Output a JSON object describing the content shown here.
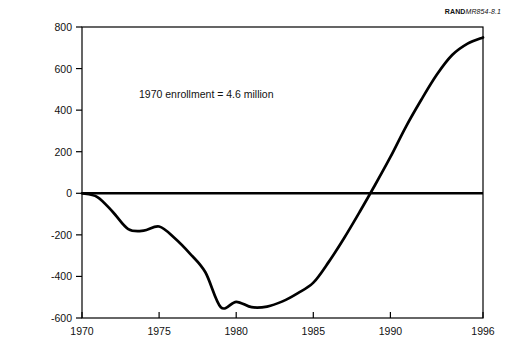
{
  "figure": {
    "document_code_brand": "RAND",
    "document_code_number": "MR854-8.1"
  },
  "annotation": {
    "note": "1970 enrollment = 4.6 million"
  },
  "chart_data": {
    "type": "line",
    "title": "",
    "subtitle": "",
    "xlabel": "",
    "ylabel": "K−12 enrollment relative to 1970 (thousands)",
    "xlim": [
      1970,
      1996
    ],
    "ylim": [
      -600,
      800
    ],
    "grid": false,
    "legend": false,
    "legend_position": "none",
    "line_color": "#000000",
    "zero_line": 0,
    "xticks": [
      1970,
      1975,
      1980,
      1985,
      1990,
      1996
    ],
    "xtick_labels": [
      "1970",
      "1975",
      "1980",
      "1985",
      "1990",
      "1996"
    ],
    "yticks": [
      -600,
      -400,
      -200,
      0,
      200,
      400,
      600,
      800
    ],
    "ytick_labels": [
      "-600",
      "-400",
      "-200",
      "0",
      "200",
      "400",
      "600",
      "800"
    ],
    "annotations": [
      {
        "text": "1970 enrollment = 4.6 million",
        "x": 1974.2,
        "y": 470
      }
    ],
    "series": [
      {
        "name": "K-12 enrollment relative to 1970",
        "x": [
          1970,
          1971,
          1972,
          1973,
          1974,
          1975,
          1976,
          1977,
          1978,
          1979,
          1980,
          1981,
          1982,
          1983,
          1984,
          1985,
          1986,
          1987,
          1988,
          1989,
          1990,
          1991,
          1992,
          1993,
          1994,
          1995,
          1996
        ],
        "values": [
          0,
          -18,
          -90,
          -172,
          -180,
          -160,
          -215,
          -290,
          -380,
          -548,
          -522,
          -548,
          -545,
          -520,
          -480,
          -430,
          -330,
          -215,
          -90,
          40,
          175,
          320,
          450,
          570,
          665,
          720,
          750
        ]
      }
    ]
  }
}
